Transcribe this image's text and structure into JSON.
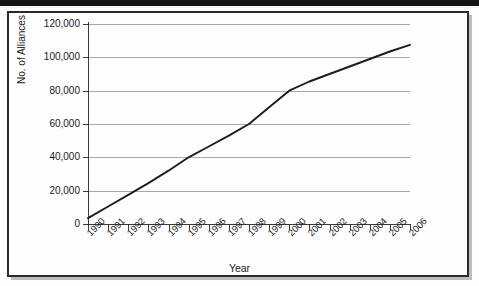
{
  "chart_data": {
    "type": "line",
    "title": "",
    "xlabel": "Year",
    "ylabel": "No. of Alliances",
    "x": [
      1990,
      1991,
      1992,
      1993,
      1994,
      1995,
      1996,
      1997,
      1998,
      1999,
      2000,
      2001,
      2002,
      2003,
      2004,
      2005,
      2006
    ],
    "categories": [
      "1990",
      "1991",
      "1992",
      "1993",
      "1994",
      "1995",
      "1996",
      "1997",
      "1998",
      "1999",
      "2000",
      "2001",
      "2002",
      "2003",
      "2004",
      "2005",
      "2006"
    ],
    "values": [
      3500,
      10500,
      17500,
      24500,
      32000,
      40000,
      46500,
      53000,
      60000,
      70000,
      80000,
      85500,
      90000,
      94500,
      99000,
      103500,
      107500
    ],
    "series": [
      {
        "name": "No. of Alliances",
        "values": [
          3500,
          10500,
          17500,
          24500,
          32000,
          40000,
          46500,
          53000,
          60000,
          70000,
          80000,
          85500,
          90000,
          94500,
          99000,
          103500,
          107500
        ]
      }
    ],
    "ylim": [
      0,
      120000
    ],
    "xlim": [
      1990,
      2006
    ],
    "yticks": [
      0,
      20000,
      40000,
      60000,
      80000,
      100000,
      120000
    ],
    "ytick_labels": [
      "0",
      "20,000",
      "40,000",
      "60,000",
      "80,000",
      "100,000",
      "120,000"
    ],
    "grid": true,
    "grid_axis": "y",
    "legend": false,
    "legend_position": "none",
    "line_color": "#1c1c1c",
    "grid_color": "#a9a9a9",
    "axis_color": "#3a3a3a",
    "background_color": "#fefefe",
    "frame_color": "#2b2b2b",
    "annotations": []
  }
}
